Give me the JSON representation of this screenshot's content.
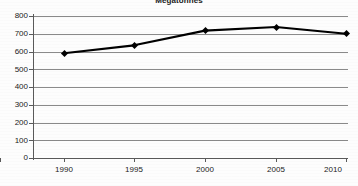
{
  "chart_data": {
    "type": "line",
    "title": "Megatonnes",
    "subtitle": "",
    "xlabel": "",
    "ylabel": "",
    "categories": [
      "1990",
      "1995",
      "2000",
      "2005",
      "2010"
    ],
    "x": [
      1990,
      1995,
      2000,
      2005,
      2010
    ],
    "values": [
      590,
      635,
      718,
      738,
      700
    ],
    "series": [
      {
        "name": "Megatonnes",
        "values": [
          590,
          635,
          718,
          738,
          700
        ]
      }
    ],
    "ytick_labels": [
      "800",
      "700",
      "600",
      "500",
      "400",
      "300",
      "200",
      "100",
      "0"
    ],
    "yticks": [
      800,
      700,
      600,
      500,
      400,
      300,
      200,
      100,
      0
    ],
    "ylim": [
      0,
      800
    ],
    "xlim": [
      1990,
      2010
    ],
    "grid": true,
    "grid_axis": "y",
    "legend": false,
    "legend_position": "none",
    "marker": "diamond",
    "line_color": "#000000",
    "grid_color": "#8a8a8a",
    "background_color": "#fdfdfd",
    "annotations": []
  }
}
